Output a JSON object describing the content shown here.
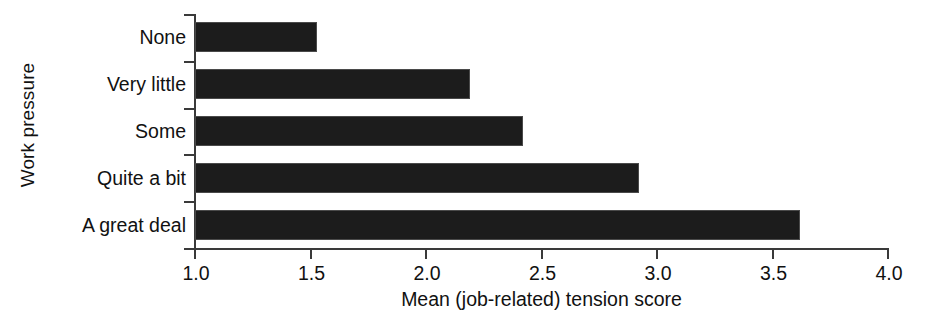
{
  "chart_data": {
    "type": "bar",
    "orientation": "horizontal",
    "title": "",
    "xlabel": "Mean (job-related) tension score",
    "ylabel": "Work pressure",
    "categories": [
      "None",
      "Very little",
      "Some",
      "Quite a bit",
      "A great deal"
    ],
    "values": [
      1.53,
      2.19,
      2.42,
      2.92,
      3.62
    ],
    "xlim": [
      1.0,
      4.0
    ],
    "xticks": [
      1.0,
      1.5,
      2.0,
      2.5,
      3.0,
      3.5,
      4.0
    ],
    "xticklabels": [
      "1.0",
      "1.5",
      "2.0",
      "2.5",
      "3.0",
      "3.5",
      "4.0"
    ],
    "grid": false,
    "legend": null,
    "bar_color": "#1c1c1c",
    "axis_color": "#3a3a3a",
    "background_color": "#ffffff"
  }
}
